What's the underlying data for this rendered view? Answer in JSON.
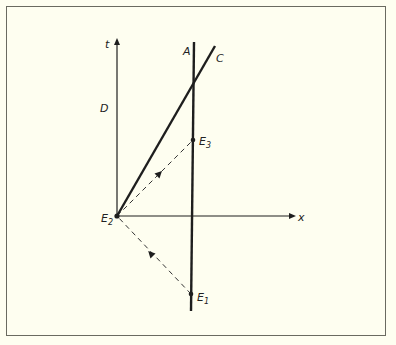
{
  "diagram": {
    "type": "spacetime-diagram",
    "colors": {
      "background": "#fefef0",
      "ink": "#1e1e1e",
      "frame": "#6a6a60"
    },
    "axes": {
      "t_label": "t",
      "x_label": "x"
    },
    "worldlines": {
      "D_label": "D",
      "A_label": "A",
      "C_label": "C"
    },
    "events": [
      {
        "name": "E",
        "sub": "1"
      },
      {
        "name": "E",
        "sub": "2"
      },
      {
        "name": "E",
        "sub": "3"
      }
    ]
  }
}
